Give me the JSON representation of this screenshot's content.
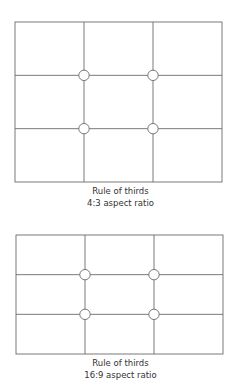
{
  "diagrams": [
    {
      "caption_line1": "Rule of thirds",
      "caption_line2": "4:3 aspect ratio",
      "frame": {
        "x": 15,
        "y": 22,
        "w": 207,
        "h": 160
      },
      "aspect_ratio": "4:3"
    },
    {
      "caption_line1": "Rule of thirds",
      "caption_line2": "16:9 aspect ratio",
      "frame": {
        "x": 16,
        "y": 235,
        "w": 207,
        "h": 119
      },
      "aspect_ratio": "16:9"
    }
  ],
  "colors": {
    "line": "#6b6b6b",
    "text": "#333333",
    "background": "#ffffff"
  }
}
